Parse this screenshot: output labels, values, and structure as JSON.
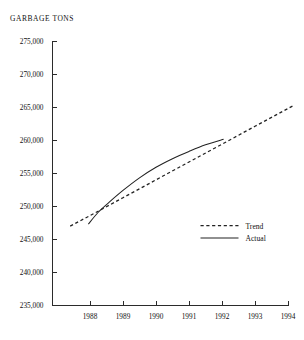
{
  "chart_data": {
    "type": "line",
    "title": "GARBAGE TONS",
    "xlabel": "",
    "ylabel": "",
    "grid": false,
    "legend_position": "inside-lower-right",
    "xlim": [
      1987.4,
      1994.3
    ],
    "ylim": [
      235000,
      275000
    ],
    "x_ticks": [
      1988,
      1989,
      1990,
      1991,
      1992,
      1993,
      1994
    ],
    "x_tick_labels": [
      "1988",
      "1989",
      "1990",
      "1991",
      "1992",
      "1993",
      "1994"
    ],
    "y_ticks": [
      235000,
      240000,
      245000,
      250000,
      255000,
      260000,
      265000,
      270000,
      275000
    ],
    "y_tick_labels": [
      "235,000",
      "240,000",
      "245,000",
      "250,000",
      "255,000",
      "260,000",
      "265,000",
      "270,000",
      "275,000"
    ],
    "series": [
      {
        "name": "Trend",
        "style": "dashed",
        "color": "#222222",
        "x": [
          1987.4,
          1988,
          1989,
          1990,
          1991,
          1992,
          1993,
          1994.15
        ],
        "values": [
          247000,
          248600,
          251300,
          254000,
          256700,
          259400,
          262100,
          265200
        ]
      },
      {
        "name": "Actual",
        "style": "solid",
        "color": "#222222",
        "x": [
          1987.95,
          1988.25,
          1988.6,
          1989,
          1989.5,
          1990,
          1990.5,
          1991,
          1991.5,
          1992.05
        ],
        "values": [
          247300,
          249100,
          250700,
          252400,
          254300,
          255900,
          257200,
          258300,
          259300,
          260150
        ]
      }
    ],
    "legend": [
      {
        "label": "Trend",
        "style": "dashed"
      },
      {
        "label": "Actual",
        "style": "solid"
      }
    ]
  }
}
